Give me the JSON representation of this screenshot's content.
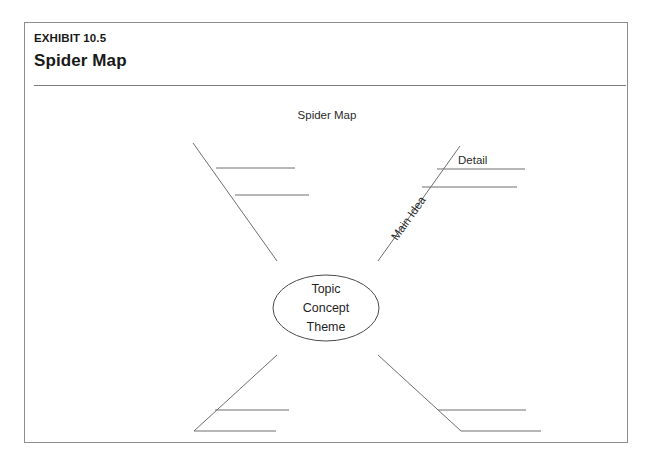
{
  "exhibit": {
    "number": "EXHIBIT 10.5",
    "title": "Spider Map"
  },
  "diagram": {
    "caption": "Spider Map",
    "center_node": {
      "line1": "Topic",
      "line2": "Concept",
      "line3": "Theme"
    },
    "labels": {
      "main_idea": "Main Idea",
      "detail": "Detail"
    },
    "colors": {
      "frame_border": "#8d8d8d",
      "rule": "#7d7d7d",
      "line": "#6f6f6f",
      "text": "#1f1f1f",
      "background": "#ffffff"
    }
  }
}
